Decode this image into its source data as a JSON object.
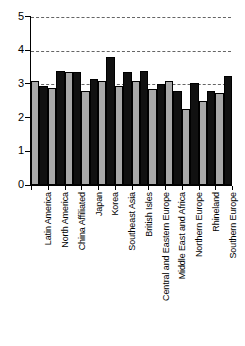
{
  "chart_data": {
    "type": "bar",
    "title": "",
    "subtitle": "",
    "xlabel": "",
    "ylabel": "",
    "ylim": [
      0,
      5
    ],
    "yticks": [
      0,
      1,
      2,
      3,
      4,
      5
    ],
    "ytick_labels": [
      "0",
      "1",
      "2",
      "3",
      "4",
      "5"
    ],
    "grid": "horizontal dashed gridlines at 3, 4 and 5",
    "gridlines": [
      3,
      4,
      5
    ],
    "legend": "none",
    "legend_position": "none",
    "orientation": "vertical grouped bars",
    "categories": [
      "Latin America",
      "North America",
      "China Affiliated",
      "Japan",
      "Korea",
      "Southeast Asia",
      "British Isles",
      "Central and Eastern Europe",
      "Middle East and Africa",
      "Northern Europe",
      "Rhineland",
      "Southern Europe"
    ],
    "series": [
      {
        "name": "series-1",
        "color": "#a8a8a8",
        "values": [
          3.1,
          2.9,
          3.35,
          2.8,
          3.1,
          2.95,
          3.1,
          2.85,
          3.1,
          2.25,
          2.5,
          2.75
        ]
      },
      {
        "name": "series-2",
        "color": "#111111",
        "values": [
          2.95,
          3.4,
          3.35,
          3.15,
          3.8,
          3.35,
          3.4,
          3.0,
          2.8,
          3.05,
          2.8,
          3.25
        ]
      }
    ]
  },
  "axes": {
    "y_axis_name": "value-axis",
    "x_axis_name": "category-axis"
  }
}
